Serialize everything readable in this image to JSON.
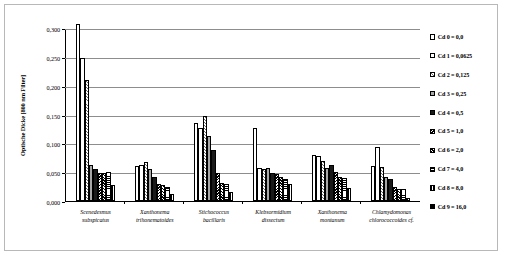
{
  "chart_data": {
    "type": "bar",
    "title": "",
    "xlabel": "",
    "ylabel": "Optische Dicke [800 nm Filter]",
    "ylim": [
      0,
      0.3
    ],
    "ytick_labels": [
      "0,300",
      "0,250",
      "0,200",
      "0,150",
      "0,100",
      "0,050",
      "0,000"
    ],
    "ytick_values": [
      0.3,
      0.25,
      0.2,
      0.15,
      0.1,
      0.05,
      0.0
    ],
    "grid": true,
    "legend_position": "right",
    "categories": [
      "Scenedesmus subspicatus",
      "Xanthonema trihonematoides",
      "Stichococcus bacillaris",
      "Klebsormidium dissectum",
      "Xanthonema montanum",
      "Chlamydomonas chlorococcoides cf."
    ],
    "category_lines": [
      [
        "Scenedesmus",
        "subspicatus"
      ],
      [
        "Xanthonema",
        "trihonematoides"
      ],
      [
        "Stichococcus",
        "bacillaris"
      ],
      [
        "Klebsormidium",
        "dissectum"
      ],
      [
        "Xanthonema",
        "montanum"
      ],
      [
        "Chlamydomonas",
        "chlorococcoides cf."
      ]
    ],
    "series": [
      {
        "name": "Cd 0 = 0,0",
        "values": [
          0.307,
          0.06,
          0.135,
          0.127,
          0.08,
          0.061
        ]
      },
      {
        "name": "Cd 1 = 0,0625",
        "values": [
          0.248,
          0.063,
          0.127,
          0.058,
          0.078,
          0.094
        ]
      },
      {
        "name": "Cd 2 = 0,125",
        "values": [
          0.21,
          0.068,
          0.147,
          0.055,
          0.07,
          0.059
        ]
      },
      {
        "name": "Cd 3 = 0,25",
        "values": [
          0.063,
          0.055,
          0.113,
          0.057,
          0.058,
          0.042
        ]
      },
      {
        "name": "Cd 4 = 0,5",
        "values": [
          0.055,
          0.042,
          0.088,
          0.048,
          0.062,
          0.038
        ]
      },
      {
        "name": "Cd 5 = 1,0",
        "values": [
          0.048,
          0.03,
          0.048,
          0.047,
          0.05,
          0.025
        ]
      },
      {
        "name": "Cd 6 = 2,0",
        "values": [
          0.048,
          0.028,
          0.032,
          0.041,
          0.041,
          0.021
        ]
      },
      {
        "name": "Cd 7 = 4,0",
        "values": [
          0.05,
          0.025,
          0.03,
          0.038,
          0.04,
          0.02
        ]
      },
      {
        "name": "Cd 8 = 8,0",
        "values": [
          0.028,
          0.012,
          0.016,
          0.03,
          0.022,
          0.005
        ]
      },
      {
        "name": "Cd 9 = 16,0",
        "values": [
          null,
          null,
          null,
          null,
          null,
          null
        ]
      }
    ]
  },
  "legend": {
    "items": [
      {
        "label": "Cd 0 = 0,0"
      },
      {
        "label": "Cd 1 = 0,0625"
      },
      {
        "label": "Cd 2 = 0,125"
      },
      {
        "label": "Cd 3 = 0,25"
      },
      {
        "label": "Cd 4 = 0,5"
      },
      {
        "label": "Cd 5 = 1,0"
      },
      {
        "label": "Cd 6 = 2,0"
      },
      {
        "label": "Cd 7 = 4,0"
      },
      {
        "label": "Cd 8 = 8,0"
      },
      {
        "label": "Cd 9 = 16,0"
      }
    ]
  }
}
